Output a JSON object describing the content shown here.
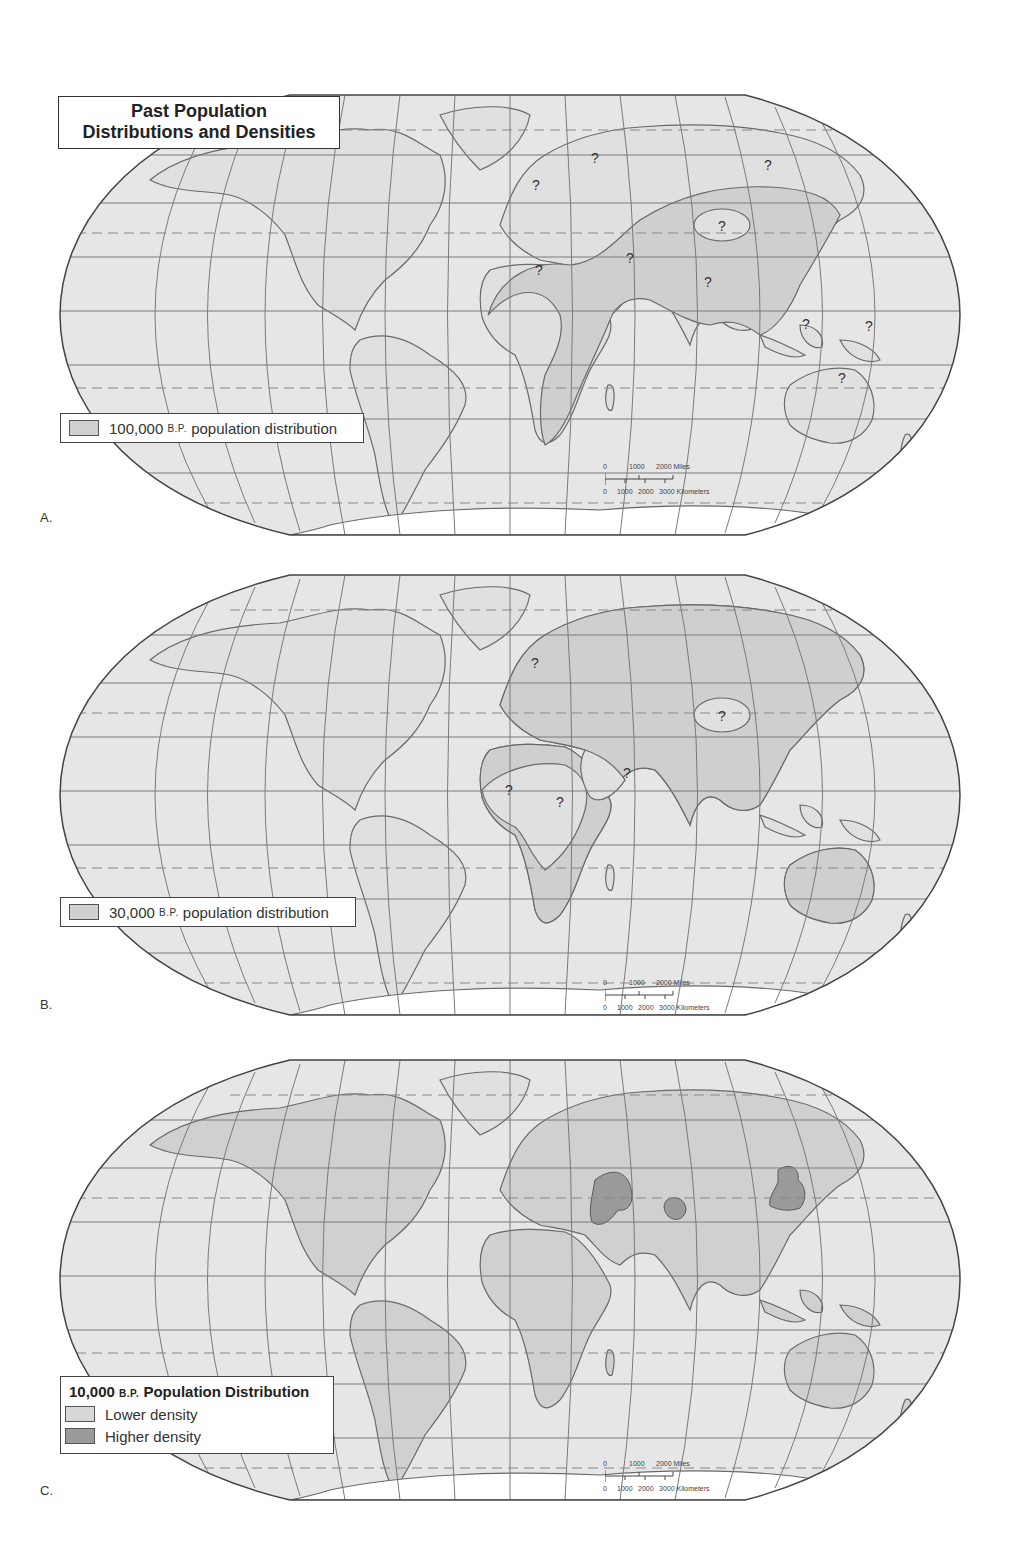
{
  "title": "Past Population Distributions and Densities",
  "title_lines": [
    "Past Population",
    "Distributions and Densities"
  ],
  "colors": {
    "ocean": "#e6e6e6",
    "land": "#e1e1e1",
    "population_lower": "#d0d0d0",
    "population_higher": "#9a9a9a",
    "coastline": "#6e6e6e",
    "graticule": "#777777"
  },
  "scale_bar": {
    "miles_labels": [
      "0",
      "1000",
      "2000 Miles"
    ],
    "km_labels": [
      "0",
      "1000",
      "2000",
      "3000 Kilometers"
    ]
  },
  "maps": [
    {
      "panel_label": "A.",
      "legend": {
        "swatch": "lower",
        "value": "100,000",
        "unit": "B.P.",
        "text": "population distribution"
      },
      "uncertain_regions": [
        "Northern Europe",
        "Central Europe",
        "Siberia",
        "Central Asia (Tibet)",
        "Sahara",
        "Arabia",
        "South India",
        "Indonesia",
        "New Guinea",
        "Australia"
      ]
    },
    {
      "panel_label": "B.",
      "legend": {
        "swatch": "lower",
        "value": "30,000",
        "unit": "B.P.",
        "text": "population distribution"
      },
      "uncertain_regions": [
        "Central Europe",
        "Central Asia (Tibet)",
        "Western Sahara",
        "Central Sahara",
        "Arabia"
      ]
    },
    {
      "panel_label": "C.",
      "legend": {
        "header_value": "10,000",
        "header_unit": "B.P.",
        "header_text": "Population Distribution",
        "items": [
          {
            "label": "Lower density",
            "swatch": "lower"
          },
          {
            "label": "Higher density",
            "swatch": "higher"
          }
        ]
      },
      "higher_density_regions": [
        "Fertile Crescent",
        "Indus Valley",
        "Yellow River / North China"
      ]
    }
  ],
  "uncertain_marker": "?"
}
